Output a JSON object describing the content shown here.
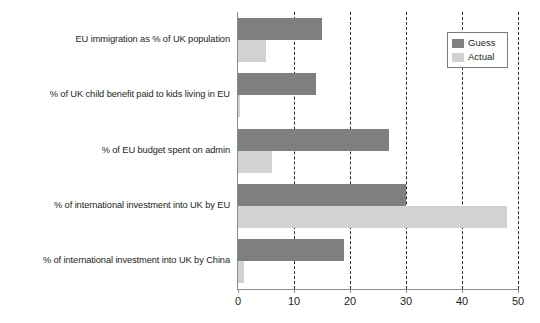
{
  "chart_data": {
    "type": "bar",
    "orientation": "horizontal",
    "title": "",
    "xlabel": "",
    "ylabel": "",
    "xlim": [
      0,
      50
    ],
    "xticks": [
      "0",
      "10",
      "20",
      "30",
      "40",
      "50"
    ],
    "grid": "vertical-dashed",
    "legend_position": "top-right",
    "categories": [
      "EU immigration as % of UK population",
      "% of UK child benefit paid to kids living in EU",
      "% of EU budget spent on admin",
      "% of international investment into UK by EU",
      "% of international investment into UK by China"
    ],
    "series": [
      {
        "name": "Guess",
        "color": "#7f7f7f",
        "values": [
          15,
          14,
          27,
          30,
          19
        ]
      },
      {
        "name": "Actual",
        "color": "#d2d2d2",
        "values": [
          5,
          0.3,
          6,
          48,
          1
        ]
      }
    ]
  },
  "legend": {
    "items": [
      {
        "label": "Guess"
      },
      {
        "label": "Actual"
      }
    ]
  }
}
